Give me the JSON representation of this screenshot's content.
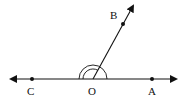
{
  "diagram": {
    "title": "",
    "line": {
      "from": "C",
      "to": "A",
      "arrows": "both"
    },
    "ray": {
      "from": "O",
      "through": "B",
      "arrow": true
    },
    "points": [
      {
        "name": "C",
        "label": "C",
        "x": 32,
        "y": 79
      },
      {
        "name": "O",
        "label": "O",
        "x": 93,
        "y": 79
      },
      {
        "name": "A",
        "label": "A",
        "x": 152,
        "y": 79
      },
      {
        "name": "B",
        "label": "B",
        "x": 123,
        "y": 24
      }
    ],
    "angle_marks": [
      {
        "angle": "BOC",
        "arcs": 1,
        "radius": 10
      },
      {
        "angle": "COA",
        "arcs": 1,
        "radius": 14
      }
    ],
    "colors": {
      "stroke": "#111111",
      "background": "#ffffff"
    }
  }
}
